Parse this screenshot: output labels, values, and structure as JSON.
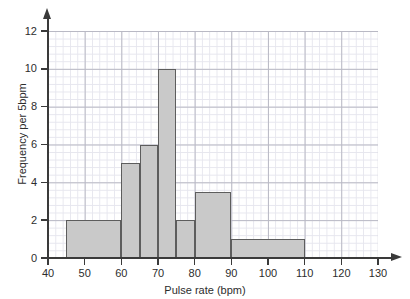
{
  "chart_data": {
    "type": "bar",
    "title": "",
    "xlabel": "Pulse rate (bpm)",
    "ylabel": "Frequency per 5bpm",
    "xlim": [
      40,
      130
    ],
    "ylim": [
      0,
      12
    ],
    "grid": true,
    "legend": null,
    "x_ticks": [
      40,
      50,
      60,
      70,
      80,
      90,
      100,
      110,
      120,
      130
    ],
    "y_ticks": [
      0,
      2,
      4,
      6,
      8,
      10,
      12
    ],
    "bars": [
      {
        "label": "45-60",
        "start": 45,
        "end": 60,
        "height": 2
      },
      {
        "label": "60-65",
        "start": 60,
        "end": 65,
        "height": 5
      },
      {
        "label": "65-70",
        "start": 65,
        "end": 70,
        "height": 6
      },
      {
        "label": "70-75",
        "start": 70,
        "end": 75,
        "height": 10
      },
      {
        "label": "75-80",
        "start": 75,
        "end": 80,
        "height": 2
      },
      {
        "label": "80-90",
        "start": 80,
        "end": 90,
        "height": 3.5
      },
      {
        "label": "90-110",
        "start": 90,
        "end": 110,
        "height": 1
      }
    ],
    "categories": [
      "45-60",
      "60-65",
      "65-70",
      "70-75",
      "75-80",
      "80-90",
      "90-110"
    ],
    "values": [
      2,
      5,
      6,
      10,
      2,
      3.5,
      1
    ],
    "colors": {
      "bar_fill": "#c9c9c9",
      "bar_stroke": "#5d5d5d",
      "axis": "#3a3a3a",
      "grid_major": "#b9b9c4",
      "grid_minor": "#e6e6ee",
      "background": "#ffffff",
      "text": "#2d2d2d"
    }
  }
}
